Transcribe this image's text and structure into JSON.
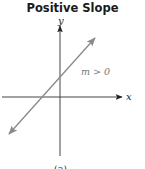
{
  "title": "Positive Slope",
  "axes": {
    "x_label": "x",
    "y_label": "y"
  },
  "line": {
    "label": "m > 0",
    "description": "Line rising left to right with arrowheads at both ends",
    "color": "#8a8a8a"
  },
  "caption": "(a)",
  "colors": {
    "axis": "#333333",
    "line": "#8a8a8a",
    "title": "#1a1a1a"
  }
}
